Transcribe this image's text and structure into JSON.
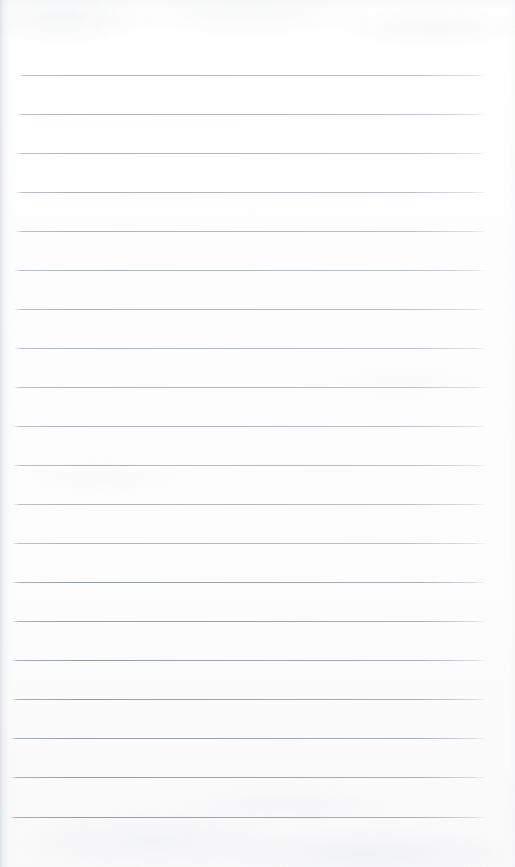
{
  "document": {
    "kind": "scanned-lined-paper",
    "title": "Blank Lined Notebook Paper",
    "content_text": "",
    "has_handwriting": false,
    "has_printed_text": false,
    "page_number_text": "",
    "background_color": "#fefefe",
    "rule_color": "#aeb3bc",
    "rule_color_dark": "#9aa0ab"
  },
  "sheet": {
    "width": 515,
    "height": 867,
    "left_margin": 15,
    "right_margin": 28,
    "top_margin": 75,
    "bottom_margin": 50
  },
  "ruling": {
    "style": "wide-ruled",
    "line_count": 20,
    "line_pitch": 39,
    "line_thickness": 1,
    "line_start_x": 15,
    "line_end_x": 487,
    "first_line_y": 75,
    "last_line_y": 817,
    "lines": [
      {
        "index": 1,
        "y": 75,
        "x1": 18,
        "x2": 487,
        "tone": "light"
      },
      {
        "index": 2,
        "y": 114,
        "x1": 16,
        "x2": 487,
        "tone": "light"
      },
      {
        "index": 3,
        "y": 153,
        "x1": 15,
        "x2": 487,
        "tone": "light"
      },
      {
        "index": 4,
        "y": 192,
        "x1": 15,
        "x2": 487,
        "tone": "light"
      },
      {
        "index": 5,
        "y": 231,
        "x1": 15,
        "x2": 487,
        "tone": "light"
      },
      {
        "index": 6,
        "y": 270,
        "x1": 14,
        "x2": 487,
        "tone": "light"
      },
      {
        "index": 7,
        "y": 309,
        "x1": 14,
        "x2": 487,
        "tone": "light"
      },
      {
        "index": 8,
        "y": 348,
        "x1": 14,
        "x2": 487,
        "tone": "light"
      },
      {
        "index": 9,
        "y": 387,
        "x1": 13,
        "x2": 487,
        "tone": "light"
      },
      {
        "index": 10,
        "y": 426,
        "x1": 13,
        "x2": 487,
        "tone": "light"
      },
      {
        "index": 11,
        "y": 465,
        "x1": 13,
        "x2": 487,
        "tone": "light"
      },
      {
        "index": 12,
        "y": 504,
        "x1": 13,
        "x2": 487,
        "tone": "light"
      },
      {
        "index": 13,
        "y": 543,
        "x1": 12,
        "x2": 487,
        "tone": "light"
      },
      {
        "index": 14,
        "y": 582,
        "x1": 12,
        "x2": 487,
        "tone": "dark"
      },
      {
        "index": 15,
        "y": 621,
        "x1": 12,
        "x2": 487,
        "tone": "dark"
      },
      {
        "index": 16,
        "y": 660,
        "x1": 11,
        "x2": 487,
        "tone": "dark"
      },
      {
        "index": 17,
        "y": 699,
        "x1": 11,
        "x2": 487,
        "tone": "dark"
      },
      {
        "index": 18,
        "y": 738,
        "x1": 10,
        "x2": 487,
        "tone": "dark"
      },
      {
        "index": 19,
        "y": 777,
        "x1": 10,
        "x2": 487,
        "tone": "dark"
      },
      {
        "index": 20,
        "y": 817,
        "x1": 9,
        "x2": 487,
        "tone": "dark"
      }
    ]
  }
}
